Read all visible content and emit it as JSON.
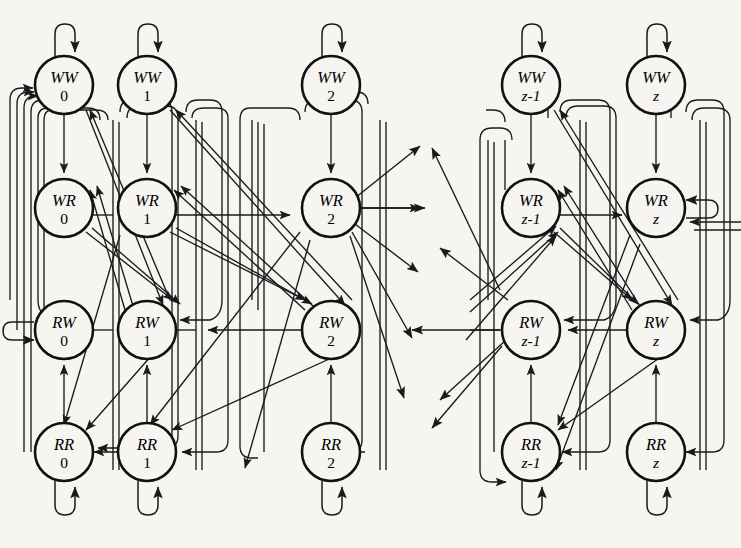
{
  "diagram": {
    "type": "state-machine-graph",
    "background_color": "#f6f5f2",
    "stroke_color": "#1a1a1a",
    "node_fill": "#f6f5f2",
    "node_radius": 29,
    "rows": [
      "WW",
      "WR",
      "RW",
      "RR"
    ],
    "columns": [
      "0",
      "1",
      "2",
      "z-1",
      "z"
    ],
    "column_gap_after_index": 2,
    "ellipsis_note": "omitted intermediate columns shown as dangling arrows",
    "nodes": [
      {
        "id": "WW0",
        "row": "WW",
        "col": "0",
        "top": "WW",
        "bottom": "0",
        "cx": 64,
        "cy": 85,
        "bottom_italic": false
      },
      {
        "id": "WW1",
        "row": "WW",
        "col": "1",
        "top": "WW",
        "bottom": "1",
        "cx": 147,
        "cy": 85,
        "bottom_italic": false
      },
      {
        "id": "WW2",
        "row": "WW",
        "col": "2",
        "top": "WW",
        "bottom": "2",
        "cx": 331,
        "cy": 85,
        "bottom_italic": false
      },
      {
        "id": "WWz1",
        "row": "WW",
        "col": "z-1",
        "top": "WW",
        "bottom": "z-1",
        "cx": 531,
        "cy": 85,
        "bottom_italic": true
      },
      {
        "id": "WWz",
        "row": "WW",
        "col": "z",
        "top": "WW",
        "bottom": "z",
        "cx": 656,
        "cy": 85,
        "bottom_italic": true
      },
      {
        "id": "WR0",
        "row": "WR",
        "col": "0",
        "top": "WR",
        "bottom": "0",
        "cx": 64,
        "cy": 208,
        "bottom_italic": false
      },
      {
        "id": "WR1",
        "row": "WR",
        "col": "1",
        "top": "WR",
        "bottom": "1",
        "cx": 147,
        "cy": 208,
        "bottom_italic": false
      },
      {
        "id": "WR2",
        "row": "WR",
        "col": "2",
        "top": "WR",
        "bottom": "2",
        "cx": 331,
        "cy": 208,
        "bottom_italic": false
      },
      {
        "id": "WRz1",
        "row": "WR",
        "col": "z-1",
        "top": "WR",
        "bottom": "z-1",
        "cx": 531,
        "cy": 208,
        "bottom_italic": true
      },
      {
        "id": "WRz",
        "row": "WR",
        "col": "z",
        "top": "WR",
        "bottom": "z",
        "cx": 656,
        "cy": 208,
        "bottom_italic": true
      },
      {
        "id": "RW0",
        "row": "RW",
        "col": "0",
        "top": "RW",
        "bottom": "0",
        "cx": 64,
        "cy": 330,
        "bottom_italic": false
      },
      {
        "id": "RW1",
        "row": "RW",
        "col": "1",
        "top": "RW",
        "bottom": "1",
        "cx": 147,
        "cy": 330,
        "bottom_italic": false
      },
      {
        "id": "RW2",
        "row": "RW",
        "col": "2",
        "top": "RW",
        "bottom": "2",
        "cx": 331,
        "cy": 330,
        "bottom_italic": false
      },
      {
        "id": "RWz1",
        "row": "RW",
        "col": "z-1",
        "top": "RW",
        "bottom": "z-1",
        "cx": 531,
        "cy": 330,
        "bottom_italic": true
      },
      {
        "id": "RWz",
        "row": "RW",
        "col": "z",
        "top": "RW",
        "bottom": "z",
        "cx": 656,
        "cy": 330,
        "bottom_italic": true
      },
      {
        "id": "RR0",
        "row": "RR",
        "col": "0",
        "top": "RR",
        "bottom": "0",
        "cx": 64,
        "cy": 452,
        "bottom_italic": false
      },
      {
        "id": "RR1",
        "row": "RR",
        "col": "1",
        "top": "RR",
        "bottom": "1",
        "cx": 147,
        "cy": 452,
        "bottom_italic": false
      },
      {
        "id": "RR2",
        "row": "RR",
        "col": "2",
        "top": "RR",
        "bottom": "2",
        "cx": 331,
        "cy": 452,
        "bottom_italic": false
      },
      {
        "id": "RRz1",
        "row": "RR",
        "col": "z-1",
        "top": "RR",
        "bottom": "z-1",
        "cx": 531,
        "cy": 452,
        "bottom_italic": true
      },
      {
        "id": "RRz",
        "row": "RR",
        "col": "z",
        "top": "RR",
        "bottom": "z",
        "cx": 656,
        "cy": 452,
        "bottom_italic": true
      }
    ],
    "self_loops": [
      {
        "node": "WW0",
        "side": "top"
      },
      {
        "node": "WW1",
        "side": "top"
      },
      {
        "node": "WW2",
        "side": "top"
      },
      {
        "node": "WWz1",
        "side": "top"
      },
      {
        "node": "WWz",
        "side": "top"
      },
      {
        "node": "RR0",
        "side": "bottom"
      },
      {
        "node": "RR1",
        "side": "bottom"
      },
      {
        "node": "RR2",
        "side": "bottom"
      },
      {
        "node": "RRz1",
        "side": "bottom"
      },
      {
        "node": "RRz",
        "side": "bottom"
      },
      {
        "node": "RW0",
        "side": "left"
      },
      {
        "node": "WRz",
        "side": "right"
      }
    ],
    "vertical_edges": [
      {
        "from": "WW0",
        "to": "WR0"
      },
      {
        "from": "WW1",
        "to": "WR1"
      },
      {
        "from": "WW2",
        "to": "WR2"
      },
      {
        "from": "WWz1",
        "to": "WRz1"
      },
      {
        "from": "WWz",
        "to": "WRz"
      },
      {
        "from": "RR0",
        "to": "RW0"
      },
      {
        "from": "RR1",
        "to": "RW1"
      },
      {
        "from": "RR2",
        "to": "RW2"
      },
      {
        "from": "RRz1",
        "to": "RWz1"
      },
      {
        "from": "RRz",
        "to": "RWz"
      }
    ],
    "horizontal_edges": [
      {
        "from": "RW0",
        "to": "RW1"
      },
      {
        "from": "RW1",
        "to": "RW2"
      },
      {
        "from": "RWz1",
        "to": "RWz"
      },
      {
        "from": "WR1",
        "to": "WR2"
      },
      {
        "from": "WRz1",
        "to": "WRz"
      }
    ],
    "dangling_arrows_note": "arrows entering and leaving the elided region between column 2 and column z-1"
  }
}
